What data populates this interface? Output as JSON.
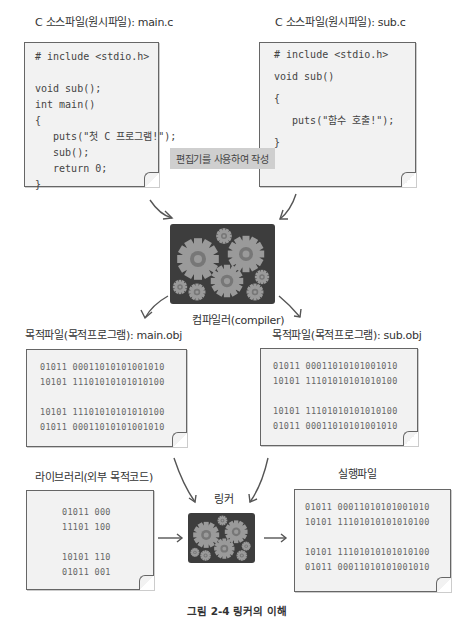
{
  "source_main": {
    "title": "C 소스파일(원시파일): main.c",
    "code": "# include <stdio.h>\n\nvoid sub();\nint main()\n{\n   puts(\"첫 C 프로그램!\");\n   sub();\n   return 0;\n}"
  },
  "source_sub": {
    "title": "C 소스파일(원시파일): sub.c",
    "code": "# include <stdio.h>\n\nvoid sub()\n\n{\n\n   puts(\"함수 호출!\");\n\n}"
  },
  "editor_tag": "편집기를 사용하여 작성",
  "compiler": {
    "label": "컴파일러(compiler)",
    "icon": "gears-icon"
  },
  "object_main": {
    "title": "목적파일(목적프로그램): main.obj",
    "lines": "01011 00011010101001010\n10101 11101010101010100\n\n10101 11101010101010100\n01011 00011010101001010"
  },
  "object_sub": {
    "title": "목적파일(목적프로그램): sub.obj",
    "lines": "01011 00011010101001010\n10101 11101010101010100\n\n10101 11101010101010100\n01011 00011010101001010"
  },
  "library": {
    "title": "라이브러리(외부 목적코드)",
    "lines": "01011 000\n11101 100\n\n10101 110\n01011 001"
  },
  "linker": {
    "label": "링커",
    "icon": "gears-icon"
  },
  "executable": {
    "title": "실행파일",
    "lines": "01011 00011010101001010\n10101 11101010101010100\n\n10101 11101010101010100\n01011 00011010101001010"
  },
  "caption": "그림 2-4  링커의 이해",
  "colors": {
    "paper": "#f2f2f2",
    "gearbox": "#3d3d3d",
    "gear": "#9a9a9a",
    "gear_hub": "#777777",
    "tag": "#cfcfcf"
  }
}
